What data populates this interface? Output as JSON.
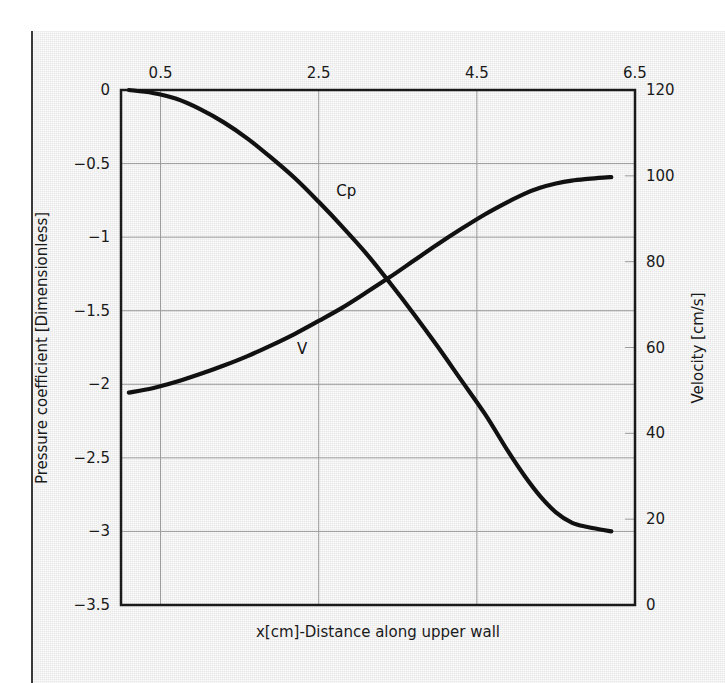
{
  "figure": {
    "background_color": "#e8e8e8",
    "plot_frame_color": "#1a1a1a",
    "grid_color": "#9a9a9a",
    "curve_color": "#111111"
  },
  "chart_data": {
    "type": "line",
    "title": "",
    "subtitle": "",
    "xlabel": "x[cm]-Distance along upper wall",
    "xlabel_position": "bottom",
    "x_axis_position": "top",
    "xlim": [
      0.0,
      6.5
    ],
    "x_ticks": [
      0.5,
      2.5,
      4.5,
      6.5
    ],
    "x_tick_labels": [
      "0.5",
      "2.5",
      "4.5",
      "6.5"
    ],
    "grid": true,
    "legend": "inline-annotations",
    "axes": [
      {
        "id": "left",
        "ylabel": "Pressure coefficient [Dimensionless]",
        "ylim": [
          -3.5,
          0
        ],
        "y_ticks": [
          0,
          -0.5,
          -1,
          -1.5,
          -2,
          -2.5,
          -3,
          -3.5
        ],
        "y_tick_labels": [
          "0",
          "−0.5",
          "−1",
          "−1.5",
          "−2",
          "−2.5",
          "−3",
          "−3.5"
        ]
      },
      {
        "id": "right",
        "ylabel": "Velocity [cm/s]",
        "ylim": [
          0,
          120
        ],
        "y_ticks": [
          0,
          20,
          40,
          60,
          80,
          100,
          120
        ],
        "y_tick_labels": [
          "0",
          "20",
          "40",
          "60",
          "80",
          "100",
          "120"
        ]
      }
    ],
    "series": [
      {
        "name": "Cp",
        "annotation": "Cp",
        "annotation_x": 2.85,
        "annotation_y": -0.72,
        "axis": "left",
        "unit": "dimensionless",
        "x": [
          0.1,
          0.4,
          0.7,
          1.0,
          1.3,
          1.6,
          1.9,
          2.2,
          2.5,
          2.8,
          3.1,
          3.4,
          3.7,
          4.0,
          4.3,
          4.6,
          4.9,
          5.1,
          5.3,
          5.5,
          5.7,
          5.9,
          6.1,
          6.2
        ],
        "y": [
          0.0,
          -0.02,
          -0.06,
          -0.13,
          -0.22,
          -0.33,
          -0.46,
          -0.6,
          -0.76,
          -0.93,
          -1.11,
          -1.31,
          -1.52,
          -1.74,
          -1.97,
          -2.2,
          -2.46,
          -2.62,
          -2.76,
          -2.87,
          -2.94,
          -2.97,
          -2.99,
          -3.0
        ]
      },
      {
        "name": "V",
        "annotation": "V",
        "annotation_x": 2.29,
        "annotation_y": 58.5,
        "axis": "right",
        "unit": "cm/s",
        "x": [
          0.1,
          0.4,
          0.7,
          1.0,
          1.3,
          1.6,
          1.9,
          2.2,
          2.5,
          2.8,
          3.1,
          3.4,
          3.7,
          4.0,
          4.3,
          4.6,
          4.9,
          5.1,
          5.3,
          5.5,
          5.7,
          5.9,
          6.1,
          6.2
        ],
        "y": [
          49.5,
          50.5,
          52.0,
          53.8,
          55.8,
          58.0,
          60.5,
          63.2,
          66.2,
          69.3,
          72.8,
          76.4,
          80.2,
          84.0,
          87.6,
          91.0,
          94.0,
          95.8,
          97.2,
          98.2,
          98.9,
          99.3,
          99.6,
          99.7
        ]
      }
    ]
  }
}
